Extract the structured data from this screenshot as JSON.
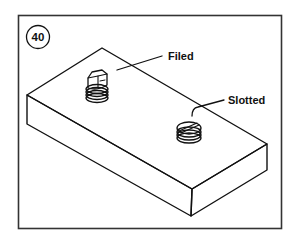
{
  "figure": {
    "number": "40",
    "labels": {
      "filed": "Filed",
      "slotted": "Slotted"
    },
    "colors": {
      "line": "#111111",
      "frame": "#333333",
      "background": "#ffffff"
    }
  }
}
